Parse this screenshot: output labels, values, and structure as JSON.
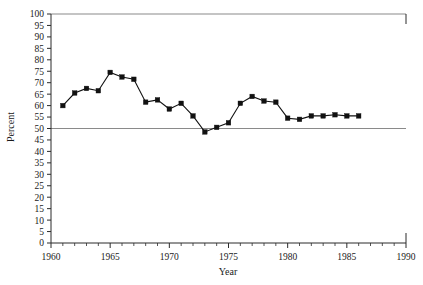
{
  "chart_data": {
    "type": "line",
    "title": "",
    "xlabel": "Year",
    "ylabel": "Percent",
    "xlim": [
      1960,
      1990
    ],
    "ylim": [
      0,
      100
    ],
    "xticks": [
      1960,
      1965,
      1970,
      1975,
      1980,
      1985,
      1990
    ],
    "xtick_labels": [
      "1960",
      "1965",
      "1970",
      "1975",
      "1980",
      "1985",
      "1990"
    ],
    "xtick_minor_step": 1,
    "yticks": [
      0,
      5,
      10,
      15,
      20,
      25,
      30,
      35,
      40,
      45,
      50,
      55,
      60,
      65,
      70,
      75,
      80,
      85,
      90,
      95,
      100
    ],
    "ytick_labels": [
      "0",
      "5",
      "10",
      "15",
      "20",
      "25",
      "30",
      "35",
      "40",
      "45",
      "50",
      "55",
      "60",
      "65",
      "70",
      "75",
      "80",
      "85",
      "90",
      "95",
      "100"
    ],
    "grid": false,
    "legend": false,
    "reference_lines": [
      {
        "name": "fifty-percent-line",
        "axis": "y",
        "value": 50,
        "color": "#8a8a8a"
      },
      {
        "name": "hundred-percent-line",
        "axis": "y",
        "value": 100,
        "color": "#8a8a8a"
      }
    ],
    "marker": "square",
    "marker_color": "#111111",
    "line_color": "#111111",
    "x": [
      1961,
      1962,
      1963,
      1964,
      1965,
      1966,
      1967,
      1968,
      1969,
      1970,
      1971,
      1972,
      1973,
      1974,
      1975,
      1976,
      1977,
      1978,
      1979,
      1980,
      1981,
      1982,
      1983,
      1984,
      1985,
      1986
    ],
    "values": [
      60,
      65.5,
      67.5,
      66.5,
      74.5,
      72.5,
      71.5,
      61.5,
      62.5,
      58.5,
      61,
      55.5,
      48.5,
      50.5,
      52.5,
      61,
      64,
      62,
      61.5,
      54.5,
      54,
      55.5,
      55.5,
      56,
      55.5,
      55.5
    ],
    "series": [
      {
        "name": "percent-series",
        "values": [
          60,
          65.5,
          67.5,
          66.5,
          74.5,
          72.5,
          71.5,
          61.5,
          62.5,
          58.5,
          61,
          55.5,
          48.5,
          50.5,
          52.5,
          61,
          64,
          62,
          61.5,
          54.5,
          54,
          55.5,
          55.5,
          56,
          55.5,
          55.5
        ]
      }
    ]
  }
}
